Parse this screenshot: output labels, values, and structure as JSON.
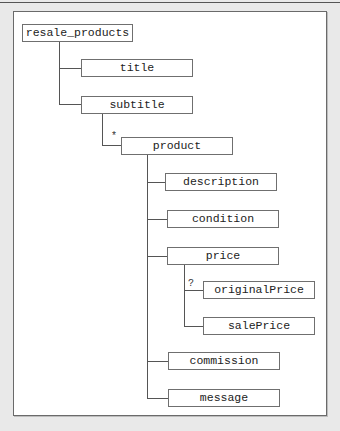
{
  "diagram": {
    "type": "tree",
    "root": {
      "label": "resale_products",
      "children": [
        {
          "label": "title"
        },
        {
          "label": "subtitle",
          "children": [
            {
              "label": "product",
              "cardinality": "*",
              "children": [
                {
                  "label": "description"
                },
                {
                  "label": "condition"
                },
                {
                  "label": "price",
                  "children": [
                    {
                      "label": "originalPrice",
                      "cardinality": "?"
                    },
                    {
                      "label": "salePrice"
                    }
                  ]
                },
                {
                  "label": "commission"
                },
                {
                  "label": "message"
                }
              ]
            }
          ]
        }
      ]
    }
  },
  "nodes": {
    "resale_products": "resale_products",
    "title": "title",
    "subtitle": "subtitle",
    "product": "product",
    "description": "description",
    "condition": "condition",
    "price": "price",
    "originalPrice": "originalPrice",
    "salePrice": "salePrice",
    "commission": "commission",
    "message": "message"
  },
  "markers": {
    "product_cardinality": "*",
    "originalPrice_cardinality": "?"
  },
  "colors": {
    "background": "#e9e9e9",
    "frame": "#ffffff",
    "border": "#6f6f6f",
    "line": "#555555"
  }
}
